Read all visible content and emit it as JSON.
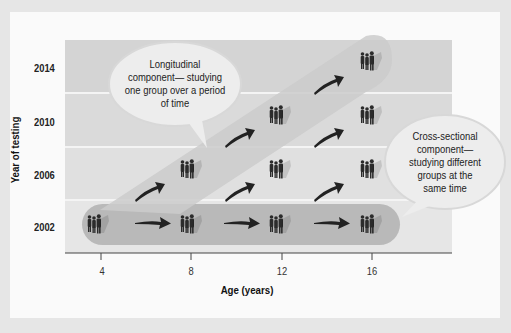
{
  "diagram": {
    "y_axis": {
      "title": "Year of testing",
      "ticks": [
        "2014",
        "2010",
        "2006",
        "2002"
      ]
    },
    "x_axis": {
      "title": "Age (years)",
      "ticks": [
        "4",
        "8",
        "12",
        "16"
      ]
    },
    "callouts": {
      "longitudinal": {
        "lines": [
          "Longitudinal",
          "component— studying",
          "one group over a period",
          "of time"
        ]
      },
      "cross_sectional": {
        "lines": [
          "Cross-sectional",
          "component—",
          "studying different",
          "groups at the",
          "same time"
        ]
      }
    },
    "groups": [
      {
        "year": "2002",
        "age": "4"
      },
      {
        "year": "2002",
        "age": "8"
      },
      {
        "year": "2002",
        "age": "12"
      },
      {
        "year": "2002",
        "age": "16"
      },
      {
        "year": "2006",
        "age": "8"
      },
      {
        "year": "2006",
        "age": "12"
      },
      {
        "year": "2006",
        "age": "16"
      },
      {
        "year": "2010",
        "age": "12"
      },
      {
        "year": "2010",
        "age": "16"
      },
      {
        "year": "2014",
        "age": "16"
      }
    ],
    "icons": {
      "group": "people-group-icon",
      "arrow": "arrow-icon"
    },
    "colors": {
      "background": "#e6e6e6",
      "panel": "#fafafa",
      "plot_top": "#d6d6d6",
      "band_rows": "#e2e2e2",
      "horizontal_band": "#b8b8b8",
      "diagonal_band": "#cfcfcf",
      "people": "#2a2a2a",
      "arrow": "#222222",
      "bubble": "#ededed"
    }
  }
}
